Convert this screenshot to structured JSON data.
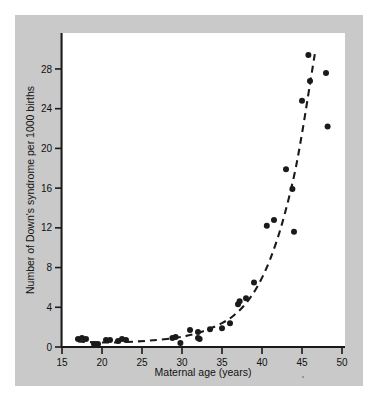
{
  "figure": {
    "panel_background": "#c9c9c9",
    "plot_background": "#ffffff",
    "ink_color": "#1a1a1a"
  },
  "chart_data": {
    "type": "scatter",
    "title": "",
    "subtitle": "",
    "xlabel": "Maternal age (years)",
    "ylabel": "Number of Down's syndrome per 1000 births",
    "xlim": [
      15,
      50
    ],
    "ylim": [
      0,
      29.5
    ],
    "xticks": [
      15,
      20,
      25,
      30,
      35,
      40,
      45,
      50
    ],
    "xtick_labels": [
      "15",
      "20",
      "25",
      "30",
      "35",
      "40",
      "45",
      "50"
    ],
    "yticks": [
      0,
      4,
      8,
      12,
      16,
      20,
      24,
      28
    ],
    "ytick_labels": [
      "0",
      "4",
      "8",
      "12",
      "16",
      "20",
      "24",
      "28"
    ],
    "grid": false,
    "legend": null,
    "marker": "filled-circle",
    "marker_color": "#1a1a1a",
    "points": [
      {
        "x": 17.0,
        "y": 0.8
      },
      {
        "x": 17.5,
        "y": 0.9
      },
      {
        "x": 18.0,
        "y": 0.8
      },
      {
        "x": 19.0,
        "y": 0.3
      },
      {
        "x": 19.5,
        "y": 0.3
      },
      {
        "x": 20.5,
        "y": 0.7
      },
      {
        "x": 21.0,
        "y": 0.7
      },
      {
        "x": 22.0,
        "y": 0.6
      },
      {
        "x": 22.5,
        "y": 0.8
      },
      {
        "x": 23.0,
        "y": 0.7
      },
      {
        "x": 28.8,
        "y": 0.9
      },
      {
        "x": 29.2,
        "y": 1.0
      },
      {
        "x": 29.8,
        "y": 0.4
      },
      {
        "x": 31.0,
        "y": 1.7
      },
      {
        "x": 32.0,
        "y": 1.5
      },
      {
        "x": 32.0,
        "y": 0.9
      },
      {
        "x": 32.2,
        "y": 0.8
      },
      {
        "x": 33.5,
        "y": 1.8
      },
      {
        "x": 35.0,
        "y": 1.9
      },
      {
        "x": 36.0,
        "y": 2.4
      },
      {
        "x": 37.0,
        "y": 4.3
      },
      {
        "x": 37.2,
        "y": 4.6
      },
      {
        "x": 38.0,
        "y": 4.9
      },
      {
        "x": 39.0,
        "y": 6.5
      },
      {
        "x": 40.6,
        "y": 12.2
      },
      {
        "x": 41.5,
        "y": 12.8
      },
      {
        "x": 43.0,
        "y": 17.9
      },
      {
        "x": 43.8,
        "y": 15.9
      },
      {
        "x": 44.0,
        "y": 11.6
      },
      {
        "x": 45.0,
        "y": 24.8
      },
      {
        "x": 45.8,
        "y": 29.4
      },
      {
        "x": 46.0,
        "y": 26.8
      },
      {
        "x": 48.0,
        "y": 27.6
      },
      {
        "x": 48.2,
        "y": 22.2
      }
    ],
    "trend_line": {
      "style": "dashed",
      "color": "#1a1a1a",
      "points": [
        {
          "x": 17.0,
          "y": 0.55
        },
        {
          "x": 20.0,
          "y": 0.45
        },
        {
          "x": 23.0,
          "y": 0.5
        },
        {
          "x": 26.0,
          "y": 0.65
        },
        {
          "x": 29.0,
          "y": 0.9
        },
        {
          "x": 31.0,
          "y": 1.2
        },
        {
          "x": 33.0,
          "y": 1.7
        },
        {
          "x": 35.0,
          "y": 2.4
        },
        {
          "x": 36.5,
          "y": 3.2
        },
        {
          "x": 38.0,
          "y": 4.4
        },
        {
          "x": 39.5,
          "y": 6.2
        },
        {
          "x": 41.0,
          "y": 8.8
        },
        {
          "x": 42.5,
          "y": 12.4
        },
        {
          "x": 44.0,
          "y": 17.2
        },
        {
          "x": 45.0,
          "y": 21.5
        },
        {
          "x": 46.0,
          "y": 26.5
        },
        {
          "x": 46.6,
          "y": 29.5
        }
      ]
    }
  }
}
